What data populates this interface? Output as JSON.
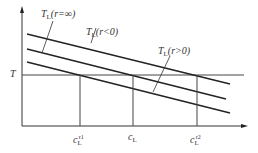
{
  "diagram": {
    "y_axis_label": "T",
    "x_ticks": [
      {
        "base": "c",
        "sub": "L",
        "sup": "r1"
      },
      {
        "base": "c",
        "sub": "L",
        "sup": ""
      },
      {
        "base": "c",
        "sub": "L",
        "sup": "r2"
      }
    ],
    "curves": [
      {
        "label_base": "T",
        "label_sub": "L",
        "label_arg": "(r=∞)"
      },
      {
        "label_base": "T",
        "label_sub": "L",
        "label_arg": "(r<0)"
      },
      {
        "label_base": "T",
        "label_sub": "L",
        "label_arg": "(r>0)"
      }
    ],
    "line_color": "#222222"
  }
}
